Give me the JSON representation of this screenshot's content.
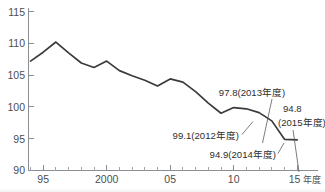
{
  "chart_data": {
    "type": "line",
    "title": "",
    "subtitle": "",
    "xlabel": "年度",
    "ylabel": "",
    "xlim": [
      1994,
      2015
    ],
    "ylim": [
      90,
      115
    ],
    "grid": false,
    "legend": "none",
    "y_ticks": [
      115,
      110,
      105,
      100,
      95,
      90
    ],
    "y_tick_labels": [
      "115",
      "110",
      "105",
      "100",
      "95",
      "90"
    ],
    "x_ticks": [
      1995,
      2000,
      2005,
      2010,
      2015
    ],
    "x_tick_labels": [
      "95",
      "2000",
      "05",
      "10",
      "15"
    ],
    "x_minor_step": 1,
    "x_axis_unit": "年度",
    "series": [
      {
        "name": "指数",
        "color": "#3a3a3a",
        "x": [
          1994,
          1995,
          1996,
          1997,
          1998,
          1999,
          2000,
          2001,
          2002,
          2003,
          2004,
          2005,
          2006,
          2007,
          2008,
          2009,
          2010,
          2011,
          2012,
          2013,
          2014,
          2015
        ],
        "values": [
          107.2,
          108.6,
          110.2,
          108.5,
          106.9,
          106.2,
          107.2,
          105.7,
          104.9,
          104.2,
          103.3,
          104.4,
          103.9,
          102.4,
          100.6,
          99.0,
          99.9,
          99.7,
          99.1,
          97.8,
          94.9,
          94.8
        ]
      }
    ],
    "annotations": [
      {
        "id": "annot-2013",
        "label": "97.8(2013年度)",
        "value": 97.8,
        "year": 2013,
        "align": "middle"
      },
      {
        "id": "annot-2015",
        "label_line1": "94.8",
        "label_line2": "(2015年度)",
        "value": 94.8,
        "year": 2015,
        "align": "start"
      },
      {
        "id": "annot-2012",
        "label": "99.1(2012年度)",
        "value": 99.1,
        "year": 2012,
        "align": "end"
      },
      {
        "id": "annot-2014",
        "label": "94.9(2014年度)",
        "value": 94.9,
        "year": 2014,
        "align": "end"
      }
    ]
  }
}
